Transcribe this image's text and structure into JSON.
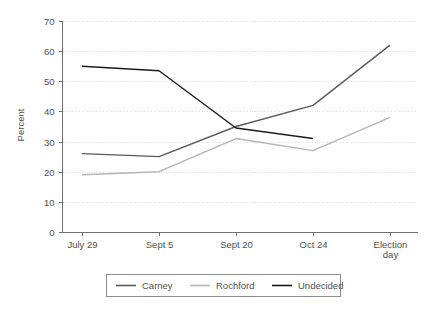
{
  "chart_data": {
    "type": "line",
    "title": "",
    "xlabel": "",
    "ylabel": "Percent",
    "ylim": [
      0,
      70
    ],
    "ytick_step": 10,
    "yticks": [
      "0",
      "10",
      "20",
      "30",
      "40",
      "50",
      "60",
      "70"
    ],
    "grid": true,
    "legend_position": "bottom",
    "categories": [
      "July 29",
      "Sept 5",
      "Sept 20",
      "Oct 24",
      "Election day"
    ],
    "series": [
      {
        "name": "Carney",
        "color": "#5a5a5a",
        "values": [
          26,
          25,
          35,
          42,
          62
        ]
      },
      {
        "name": "Rochford",
        "color": "#b5b5b5",
        "values": [
          19,
          20,
          31,
          27,
          38
        ]
      },
      {
        "name": "Undecided",
        "color": "#1c1c1c",
        "values": [
          55,
          53.5,
          34.5,
          31,
          null
        ]
      }
    ]
  },
  "axis": {
    "y_title": "Percent",
    "y_labels": [
      "70",
      "60",
      "50",
      "40",
      "30",
      "20",
      "10",
      "0"
    ],
    "x_labels": [
      {
        "line1": "July 29",
        "line2": ""
      },
      {
        "line1": "Sept 5",
        "line2": ""
      },
      {
        "line1": "Sept 20",
        "line2": ""
      },
      {
        "line1": "Oct 24",
        "line2": ""
      },
      {
        "line1": "Election",
        "line2": "day"
      }
    ]
  },
  "legend": {
    "items": [
      {
        "label": "Carney",
        "color": "#5a5a5a"
      },
      {
        "label": "Rochford",
        "color": "#b5b5b5"
      },
      {
        "label": "Undecided",
        "color": "#1c1c1c"
      }
    ]
  }
}
